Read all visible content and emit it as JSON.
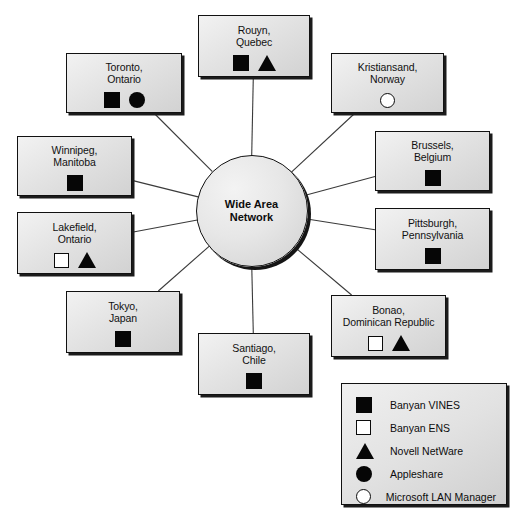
{
  "diagram": {
    "hub": {
      "label": "Wide Area\nNetwork",
      "shape": "circle"
    },
    "nodes": [
      {
        "id": "rouyn",
        "label": "Rouyn,\nQuebec",
        "symbols": [
          "filled-square",
          "triangle"
        ],
        "x": 198,
        "y": 15,
        "w": 112,
        "h": 62
      },
      {
        "id": "toronto",
        "label": "Toronto,\nOntario",
        "symbols": [
          "filled-square",
          "filled-circle"
        ],
        "x": 66,
        "y": 53,
        "w": 116,
        "h": 60
      },
      {
        "id": "kristiansand",
        "label": "Kristiansand,\nNorway",
        "symbols": [
          "open-circle"
        ],
        "x": 331,
        "y": 53,
        "w": 113,
        "h": 60
      },
      {
        "id": "winnipeg",
        "label": "Winnipeg,\nManitoba",
        "symbols": [
          "filled-square"
        ],
        "x": 17,
        "y": 136,
        "w": 115,
        "h": 60
      },
      {
        "id": "brussels",
        "label": "Brussels,\nBelgium",
        "symbols": [
          "filled-square"
        ],
        "x": 375,
        "y": 131,
        "w": 115,
        "h": 60
      },
      {
        "id": "lakefield",
        "label": "Lakefield,\nOntario",
        "symbols": [
          "open-square",
          "triangle"
        ],
        "x": 17,
        "y": 212,
        "w": 115,
        "h": 62
      },
      {
        "id": "pittsburgh",
        "label": "Pittsburgh,\nPennsylvania",
        "symbols": [
          "filled-square"
        ],
        "x": 375,
        "y": 208,
        "w": 115,
        "h": 62
      },
      {
        "id": "tokyo",
        "label": "Tokyo,\nJapan",
        "symbols": [
          "filled-square"
        ],
        "x": 66,
        "y": 291,
        "w": 114,
        "h": 62
      },
      {
        "id": "bonao",
        "label": "Bonao,\nDominican Republic",
        "symbols": [
          "open-square",
          "triangle"
        ],
        "x": 331,
        "y": 295,
        "w": 115,
        "h": 62
      },
      {
        "id": "santiago",
        "label": "Santiago,\nChile",
        "symbols": [
          "filled-square"
        ],
        "x": 198,
        "y": 333,
        "w": 112,
        "h": 62
      }
    ],
    "connections": [
      {
        "from": "hub",
        "to": "rouyn"
      },
      {
        "from": "hub",
        "to": "toronto"
      },
      {
        "from": "hub",
        "to": "kristiansand"
      },
      {
        "from": "hub",
        "to": "winnipeg"
      },
      {
        "from": "hub",
        "to": "brussels"
      },
      {
        "from": "hub",
        "to": "lakefield"
      },
      {
        "from": "hub",
        "to": "pittsburgh"
      },
      {
        "from": "hub",
        "to": "tokyo"
      },
      {
        "from": "hub",
        "to": "bonao"
      },
      {
        "from": "hub",
        "to": "santiago"
      }
    ]
  },
  "legend": {
    "items": [
      {
        "symbol": "filled-square",
        "label": "Banyan VINES"
      },
      {
        "symbol": "open-square",
        "label": "Banyan ENS"
      },
      {
        "symbol": "triangle",
        "label": "Novell NetWare"
      },
      {
        "symbol": "filled-circle",
        "label": "Appleshare"
      },
      {
        "symbol": "open-circle",
        "label": "Microsoft LAN Manager"
      }
    ]
  },
  "colors": {
    "stroke": "#111111",
    "fill_light": "#f2f2f2",
    "fill_dark": "#cfcfcf",
    "symbol": "#060606",
    "background": "#ffffff"
  }
}
